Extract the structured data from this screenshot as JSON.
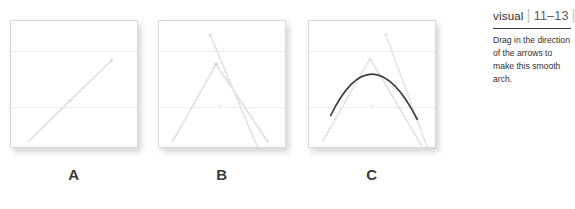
{
  "figure": {
    "title_word": "visual",
    "divider_glyph": "|",
    "page_range": "11–13",
    "caption": "Drag in the direction of the arrows to make this smooth arch.",
    "colors": {
      "panel_border": "#d8d8d8",
      "gridline": "#ececec",
      "guide_line": "#e0e0e0",
      "arch_stroke": "#3c3c3c",
      "label_text": "#3a3a3a",
      "rule": "#3d3d3d",
      "background": "#ffffff"
    },
    "panels": [
      {
        "id": "a",
        "label": "A",
        "description": "Single diagonal guide line rising from lower-left to upper-right",
        "gridlines_y": [
          31,
          88
        ],
        "elements": [
          {
            "kind": "guide-line",
            "name": "diagonal-guide-line",
            "x1": 18,
            "y1": 122,
            "x2": 102,
            "y2": 40
          },
          {
            "kind": "handle-dot",
            "name": "start-handle",
            "cx": 18,
            "cy": 122
          },
          {
            "kind": "handle-dot",
            "name": "mid-handle",
            "cx": 60,
            "cy": 81
          },
          {
            "kind": "handle-dot",
            "name": "end-handle",
            "cx": 102,
            "cy": 40
          }
        ]
      },
      {
        "id": "b",
        "label": "B",
        "description": "Tent shape of two guide lines meeting at an apex, plus a steep descending guide line",
        "gridlines_y": [
          31,
          88
        ],
        "elements": [
          {
            "kind": "guide-line",
            "name": "left-ascending-guide-line",
            "x1": 14,
            "y1": 122,
            "x2": 58,
            "y2": 44
          },
          {
            "kind": "guide-line",
            "name": "right-descending-guide-line",
            "x1": 58,
            "y1": 44,
            "x2": 110,
            "y2": 122
          },
          {
            "kind": "guide-line",
            "name": "steep-drag-guide-line",
            "x1": 52,
            "y1": 14,
            "x2": 100,
            "y2": 128
          },
          {
            "kind": "handle-dot",
            "name": "apex-handle",
            "cx": 58,
            "cy": 44
          },
          {
            "kind": "handle-dot",
            "name": "drag-start-handle",
            "cx": 52,
            "cy": 14
          },
          {
            "kind": "handle-dot",
            "name": "left-base-handle",
            "cx": 14,
            "cy": 122
          },
          {
            "kind": "handle-dot",
            "name": "right-base-handle",
            "cx": 110,
            "cy": 122
          },
          {
            "kind": "handle-dot",
            "name": "center-reference-dot",
            "cx": 62,
            "cy": 86
          }
        ]
      },
      {
        "id": "c",
        "label": "C",
        "description": "Finished smooth dark arch curve drawn over the faint guide lines",
        "gridlines_y": [
          31,
          88
        ],
        "elements": [
          {
            "kind": "guide-line",
            "name": "left-ascending-guide-line",
            "x1": 14,
            "y1": 122,
            "x2": 62,
            "y2": 38
          },
          {
            "kind": "guide-line",
            "name": "right-descending-guide-line",
            "x1": 62,
            "y1": 38,
            "x2": 114,
            "y2": 126
          },
          {
            "kind": "guide-line",
            "name": "steep-drag-guide-line",
            "x1": 78,
            "y1": 14,
            "x2": 120,
            "y2": 128
          },
          {
            "kind": "arch-curve",
            "name": "smooth-arch-curve",
            "start_x": 22,
            "start_y": 96,
            "control_x": 64,
            "control_y": 10,
            "end_x": 110,
            "end_y": 100
          },
          {
            "kind": "handle-dot",
            "name": "arch-left-handle",
            "cx": 22,
            "cy": 96
          },
          {
            "kind": "handle-dot",
            "name": "arch-right-handle",
            "cx": 110,
            "cy": 100
          },
          {
            "kind": "handle-dot",
            "name": "center-reference-dot",
            "cx": 64,
            "cy": 86
          },
          {
            "kind": "handle-dot",
            "name": "drag-start-handle",
            "cx": 78,
            "cy": 14
          }
        ]
      }
    ]
  }
}
